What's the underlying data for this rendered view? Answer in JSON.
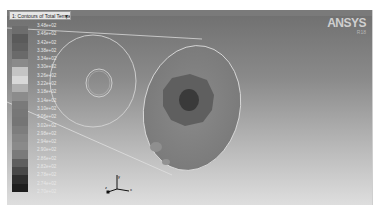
{
  "viewport": {
    "contour_selector": {
      "label": "1: Contours of Total Tempera",
      "arrow": "▼"
    },
    "logo": {
      "text": "ANSYS",
      "subtext": "R18"
    }
  },
  "legend": {
    "items": [
      {
        "value": "3.48e+02",
        "color": "#6d6d6d"
      },
      {
        "value": "3.46e+02",
        "color": "#5a5a5a"
      },
      {
        "value": "3.42e+02",
        "color": "#606060"
      },
      {
        "value": "3.38e+02",
        "color": "#6a6a6a"
      },
      {
        "value": "3.34e+02",
        "color": "#8a8a8a"
      },
      {
        "value": "3.30e+02",
        "color": "#c4c4c4"
      },
      {
        "value": "3.26e+02",
        "color": "#d8d8d8"
      },
      {
        "value": "3.22e+02",
        "color": "#b0b0b0"
      },
      {
        "value": "3.18e+02",
        "color": "#8c8c8c"
      },
      {
        "value": "3.14e+02",
        "color": "#7a7a7a"
      },
      {
        "value": "3.10e+02",
        "color": "#777777"
      },
      {
        "value": "3.06e+02",
        "color": "#757575"
      },
      {
        "value": "3.02e+02",
        "color": "#7d7d7d"
      },
      {
        "value": "2.98e+02",
        "color": "#858585"
      },
      {
        "value": "2.94e+02",
        "color": "#8a8a8a"
      },
      {
        "value": "2.90e+02",
        "color": "#7a7a7a"
      },
      {
        "value": "2.86e+02",
        "color": "#5e5e5e"
      },
      {
        "value": "2.82e+02",
        "color": "#484848"
      },
      {
        "value": "2.78e+02",
        "color": "#2e2e2e"
      },
      {
        "value": "2.74e+02",
        "color": "#1e1e1e"
      },
      {
        "value": "2.70e+02",
        "color": "#ffffff00"
      }
    ]
  },
  "axes_triad": {
    "x": "x",
    "y": "y",
    "z": "z"
  }
}
